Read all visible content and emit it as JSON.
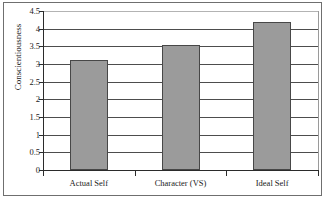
{
  "chart_data": {
    "type": "bar",
    "title": "",
    "xlabel": "",
    "ylabel": "Conscientiousness",
    "categories": [
      "Actual Self",
      "Character (VS)",
      "Ideal Self"
    ],
    "values": [
      3.1,
      3.55,
      4.2
    ],
    "ylim": [
      0,
      4.5
    ],
    "ytick_labels": [
      "0",
      "0.5",
      "1",
      "1.5",
      "2",
      "2.5",
      "3",
      "3.5",
      "4",
      "4.5"
    ],
    "ytick_values": [
      0,
      0.5,
      1,
      1.5,
      2,
      2.5,
      3,
      3.5,
      4,
      4.5
    ],
    "grid": true,
    "legend": "none",
    "bar_fill_color": "#9b9b9b",
    "bar_border_color": "#474747",
    "gridline_color": "#4d4d4d",
    "axis_color": "#2b2b2b",
    "frame_color": "#6f6f6f",
    "background_color": "#ffffff"
  }
}
